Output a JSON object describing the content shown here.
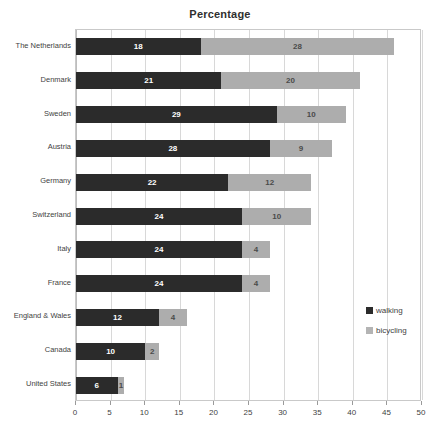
{
  "chart_data": {
    "type": "bar",
    "orientation": "horizontal",
    "stacked": true,
    "title": "Percentage",
    "xlabel": "",
    "ylabel": "",
    "xlim": [
      0,
      50
    ],
    "xticks": [
      0,
      5,
      10,
      15,
      20,
      25,
      30,
      35,
      40,
      45,
      50
    ],
    "grid": true,
    "legend_position": "right",
    "categories": [
      "The Netherlands",
      "Denmark",
      "Sweden",
      "Austria",
      "Germany",
      "Switzerland",
      "Italy",
      "France",
      "England & Wales",
      "Canada",
      "United States"
    ],
    "series": [
      {
        "name": "walking",
        "color": "#2b2b2b",
        "values": [
          18,
          21,
          29,
          28,
          22,
          24,
          24,
          24,
          12,
          10,
          6
        ]
      },
      {
        "name": "bicycling",
        "color": "#adadad",
        "values": [
          28,
          20,
          10,
          9,
          12,
          10,
          4,
          4,
          4,
          2,
          1
        ]
      }
    ],
    "totals": [
      46,
      41,
      39,
      37,
      34,
      34,
      28,
      28,
      16,
      12,
      7
    ]
  },
  "legend": {
    "items": [
      {
        "label": "walking",
        "color": "#2b2b2b"
      },
      {
        "label": "bicycling",
        "color": "#b4b4b4"
      }
    ]
  }
}
